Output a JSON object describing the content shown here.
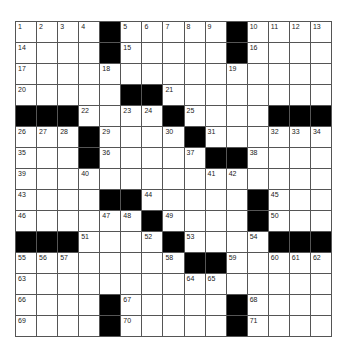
{
  "puzzle": {
    "rows": 15,
    "cols": 15,
    "grid": [
      [
        "1",
        "2",
        "3",
        "4",
        "#",
        "5",
        "6",
        "7",
        "8",
        "9",
        "#",
        "10",
        "11",
        "12",
        "13"
      ],
      [
        "14",
        "",
        "",
        "",
        "#",
        "15",
        "",
        "",
        "",
        "",
        "#",
        "16",
        "",
        "",
        ""
      ],
      [
        "17",
        "",
        "",
        "",
        "18",
        "",
        "",
        "",
        "",
        "",
        "19",
        "",
        "",
        "",
        ""
      ],
      [
        "20",
        "",
        "",
        "",
        "",
        "#",
        "#",
        "21",
        "",
        "",
        "",
        "",
        "",
        "",
        ""
      ],
      [
        "#",
        "#",
        "#",
        "22",
        "",
        "23",
        "24",
        "#",
        "25",
        "",
        "",
        "",
        "#",
        "#",
        "#"
      ],
      [
        "26",
        "27",
        "28",
        "#",
        "29",
        "",
        "",
        "30",
        "#",
        "31",
        "",
        "",
        "32",
        "33",
        "34"
      ],
      [
        "35",
        "",
        "",
        "#",
        "36",
        "",
        "",
        "",
        "37",
        "#",
        "#",
        "38",
        "",
        "",
        ""
      ],
      [
        "39",
        "",
        "",
        "40",
        "",
        "",
        "",
        "",
        "",
        "41",
        "42",
        "",
        "",
        "",
        ""
      ],
      [
        "43",
        "",
        "",
        "",
        "#",
        "#",
        "44",
        "",
        "",
        "",
        "",
        "#",
        "45",
        "",
        ""
      ],
      [
        "46",
        "",
        "",
        "",
        "47",
        "48",
        "#",
        "49",
        "",
        "",
        "",
        "#",
        "50",
        "",
        ""
      ],
      [
        "#",
        "#",
        "#",
        "51",
        "",
        "",
        "52",
        "#",
        "53",
        "",
        "",
        "54",
        "#",
        "#",
        "#"
      ],
      [
        "55",
        "56",
        "57",
        "",
        "",
        "",
        "",
        "58",
        "#",
        "#",
        "59",
        "",
        "60",
        "61",
        "62"
      ],
      [
        "63",
        "",
        "",
        "",
        "",
        "",
        "",
        "",
        "64",
        "65",
        "",
        "",
        "",
        "",
        ""
      ],
      [
        "66",
        "",
        "",
        "",
        "#",
        "67",
        "",
        "",
        "",
        "",
        "#",
        "68",
        "",
        "",
        ""
      ],
      [
        "69",
        "",
        "",
        "",
        "#",
        "70",
        "",
        "",
        "",
        "",
        "#",
        "71",
        "",
        "",
        ""
      ]
    ]
  }
}
